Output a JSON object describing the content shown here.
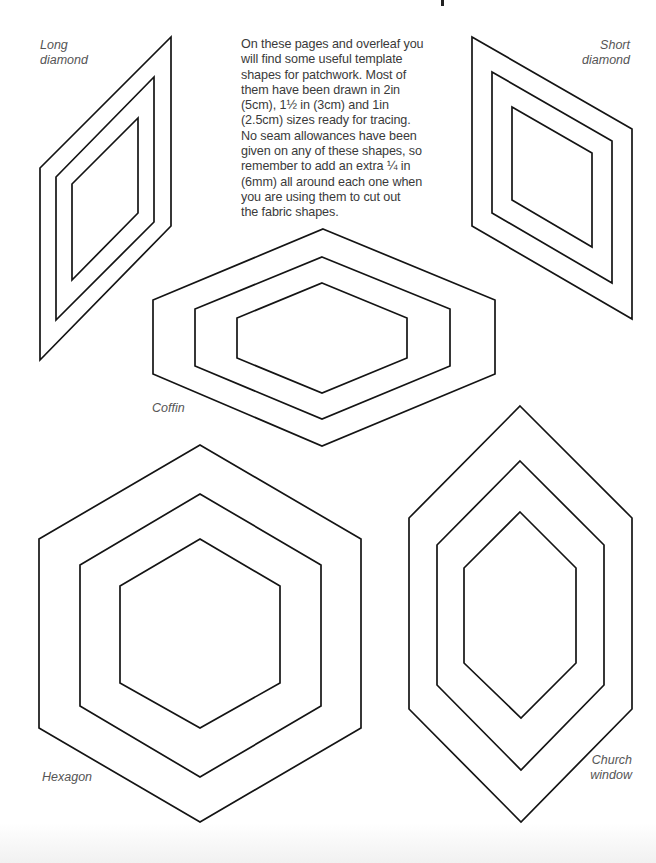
{
  "page": {
    "intro_lines": [
      "On these pages and overleaf you",
      "will find some useful template",
      "shapes for patchwork. Most of",
      "them have been drawn in 2in",
      "(5cm), 1½ in (3cm) and 1in",
      "(2.5cm) sizes ready for tracing.",
      "No seam allowances have been",
      "given on any of these shapes, so",
      "remember to add an extra ¼ in",
      "(6mm) all around each one when",
      "you are using them to cut out",
      "the fabric shapes."
    ]
  },
  "shapes": {
    "long_diamond": {
      "label_lines": [
        "Long",
        "diamond"
      ]
    },
    "short_diamond": {
      "label_lines": [
        "Short",
        "diamond"
      ]
    },
    "coffin": {
      "label_lines": [
        "Coffin"
      ]
    },
    "hexagon": {
      "label_lines": [
        "Hexagon"
      ]
    },
    "church_window": {
      "label_lines": [
        "Church",
        "window"
      ]
    }
  },
  "sizes": [
    "2in (5cm)",
    "1½in (3cm)",
    "1in (2.5cm)"
  ],
  "colors": {
    "line": "#141414",
    "text": "#3a3a3a",
    "label": "#555555",
    "background": "#ffffff"
  }
}
